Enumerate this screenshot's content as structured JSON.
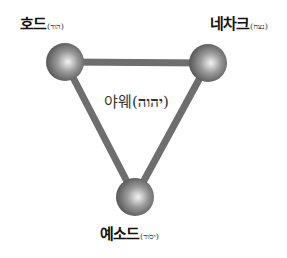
{
  "diagram": {
    "center": {
      "korean": "야웨",
      "hebrew": "יהוה",
      "open_paren": "(",
      "close_paren": ")"
    },
    "nodes": [
      {
        "id": "hod",
        "korean": "호드",
        "hebrew": "הוד"
      },
      {
        "id": "netzach",
        "korean": "네차크",
        "hebrew": "נצח"
      },
      {
        "id": "yesod",
        "korean": "예소드",
        "hebrew": "יסוד"
      }
    ],
    "edges": [
      {
        "from": "hod",
        "to": "netzach"
      },
      {
        "from": "hod",
        "to": "yesod"
      },
      {
        "from": "netzach",
        "to": "yesod"
      }
    ],
    "colors": {
      "edge": "#6e6e6e",
      "sphere_light": "#f4f4f4",
      "sphere_mid": "#9a9a9a",
      "sphere_dark": "#4a4a4a"
    }
  }
}
